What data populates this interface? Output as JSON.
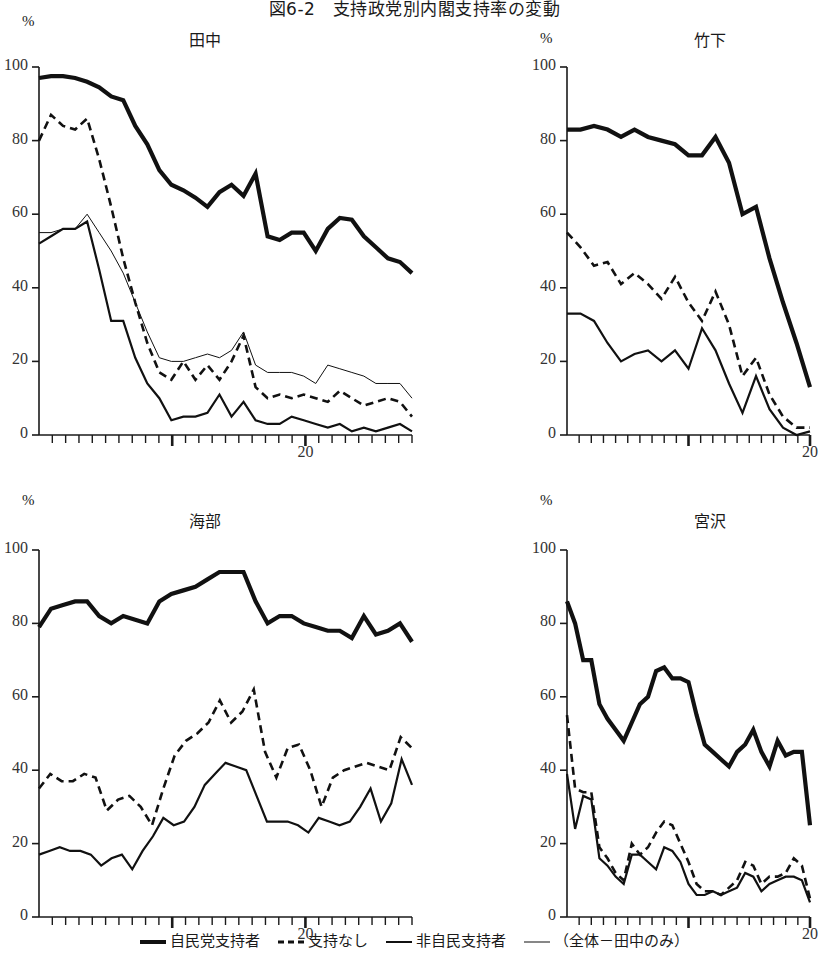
{
  "figure": {
    "title": "図6-2　支持政党別内閣支持率の変動",
    "y_axis_unit": "%",
    "y_ticks": [
      0,
      20,
      40,
      60,
      80,
      100
    ],
    "y_range": [
      0,
      100
    ]
  },
  "legend": {
    "position": "bottom-center",
    "items": [
      {
        "label": "自民党支持者",
        "style": "thick-solid",
        "color": "#111111"
      },
      {
        "label": "支持なし",
        "style": "dashed",
        "color": "#111111"
      },
      {
        "label": "非自民支持者",
        "style": "medium-solid",
        "color": "#111111"
      },
      {
        "label": "（全体－田中のみ）",
        "style": "thin-solid",
        "color": "#111111"
      }
    ]
  },
  "chart_data": [
    {
      "type": "line",
      "title": "田中",
      "ylabel": "%",
      "xlabel": "",
      "ylim": [
        0,
        100
      ],
      "grid": false,
      "n_ticks": 28,
      "x_tick_labels": [
        {
          "index": 20,
          "label": "20"
        }
      ],
      "series": [
        {
          "name": "自民党支持者",
          "style": "thick-solid",
          "values": [
            97,
            97.5,
            97.5,
            97,
            96,
            94.5,
            92,
            91,
            84,
            79,
            72,
            68,
            66.5,
            64.5,
            62,
            66,
            68,
            65,
            71,
            54,
            53,
            55,
            55,
            50,
            56,
            59,
            58.5,
            54,
            51,
            48,
            47,
            44
          ]
        },
        {
          "name": "支持なし",
          "style": "dashed",
          "values": [
            80,
            87,
            84,
            83,
            86,
            75,
            62,
            48,
            36,
            25,
            17,
            15,
            20,
            15,
            19,
            15,
            20,
            27,
            13,
            10,
            11,
            10,
            11,
            10,
            9,
            12,
            10,
            8,
            9,
            10,
            9,
            5
          ]
        },
        {
          "name": "非自民支持者",
          "style": "medium-solid",
          "values": [
            52,
            54,
            56,
            56,
            58,
            45,
            31,
            31,
            21,
            14,
            10,
            4,
            5,
            5,
            6,
            11,
            5,
            9,
            4,
            3,
            3,
            5,
            4,
            3,
            2,
            3,
            1,
            2,
            1,
            2,
            3,
            1
          ]
        },
        {
          "name": "（全体－田中のみ）",
          "style": "thin-solid",
          "values": [
            55,
            55,
            56,
            56,
            60,
            55,
            50,
            44,
            36,
            28,
            21,
            20,
            20,
            21,
            22,
            21,
            23,
            28,
            19,
            17,
            17,
            17,
            16,
            14,
            19,
            18,
            17,
            16,
            14,
            14,
            14,
            10
          ]
        }
      ]
    },
    {
      "type": "line",
      "title": "竹下",
      "ylabel": "%",
      "xlabel": "",
      "ylim": [
        0,
        100
      ],
      "grid": false,
      "n_ticks": 20,
      "x_tick_labels": [
        {
          "index": 20,
          "label": "20"
        }
      ],
      "series": [
        {
          "name": "自民党支持者",
          "style": "thick-solid",
          "values": [
            83,
            83,
            84,
            83,
            81,
            83,
            81,
            80,
            79,
            76,
            76,
            81,
            74,
            60,
            62,
            48,
            36,
            25,
            13
          ]
        },
        {
          "name": "支持なし",
          "style": "dashed",
          "values": [
            55,
            51,
            46,
            47,
            41,
            44,
            41,
            37,
            43,
            36,
            31,
            39,
            30,
            16,
            21,
            11,
            5,
            2,
            2
          ]
        },
        {
          "name": "非自民支持者",
          "style": "medium-solid",
          "values": [
            33,
            33,
            31,
            25,
            20,
            22,
            23,
            20,
            23,
            18,
            29,
            23,
            14,
            6,
            16,
            7,
            2,
            0,
            1
          ]
        }
      ]
    },
    {
      "type": "line",
      "title": "海部",
      "ylabel": "%",
      "xlabel": "",
      "ylim": [
        0,
        100
      ],
      "grid": false,
      "n_ticks": 28,
      "x_tick_labels": [
        {
          "index": 20,
          "label": "20"
        }
      ],
      "series": [
        {
          "name": "自民党支持者",
          "style": "thick-solid",
          "values": [
            79,
            84,
            85,
            86,
            86,
            82,
            80,
            82,
            81,
            80,
            86,
            88,
            89,
            90,
            92,
            94,
            94,
            94,
            86,
            80,
            82,
            82,
            80,
            79,
            78,
            78,
            76,
            82,
            77,
            78,
            80,
            75
          ]
        },
        {
          "name": "支持なし",
          "style": "dashed",
          "values": [
            35,
            39,
            37,
            37,
            39,
            38,
            29,
            32,
            33,
            30,
            25,
            35,
            44,
            48,
            50,
            53,
            59,
            53,
            56,
            62,
            45,
            38,
            46,
            47,
            40,
            30,
            38,
            40,
            41,
            42,
            41,
            40,
            49,
            46
          ]
        },
        {
          "name": "非自民支持者",
          "style": "medium-solid",
          "values": [
            17,
            18,
            19,
            18,
            18,
            17,
            14,
            16,
            17,
            13,
            18,
            22,
            27,
            25,
            26,
            30,
            36,
            39,
            42,
            41,
            40,
            33,
            26,
            26,
            26,
            25,
            23,
            27,
            26,
            25,
            26,
            30,
            35,
            26,
            31,
            43,
            36
          ]
        }
      ]
    },
    {
      "type": "line",
      "title": "宮沢",
      "ylabel": "%",
      "xlabel": "",
      "ylim": [
        0,
        100
      ],
      "grid": false,
      "n_ticks": 20,
      "x_tick_labels": [
        {
          "index": 20,
          "label": "20"
        }
      ],
      "series": [
        {
          "name": "自民党支持者",
          "style": "thick-solid",
          "values": [
            86,
            80,
            70,
            70,
            58,
            54,
            51,
            48,
            53,
            58,
            60,
            67,
            68,
            65,
            65,
            64,
            55,
            47,
            45,
            43,
            41,
            45,
            47,
            51,
            45,
            41,
            48,
            44,
            45,
            45,
            25
          ]
        },
        {
          "name": "支持なし",
          "style": "dashed",
          "values": [
            55,
            35,
            34,
            34,
            19,
            16,
            12,
            10,
            20,
            17,
            19,
            23,
            26,
            25,
            20,
            15,
            9,
            7,
            7,
            6,
            8,
            10,
            15,
            14,
            9,
            11,
            11,
            12,
            16,
            14,
            5
          ]
        },
        {
          "name": "非自民支持者",
          "style": "medium-solid",
          "values": [
            39,
            24,
            33,
            32,
            16,
            14,
            11,
            9,
            17,
            17,
            15,
            13,
            19,
            18,
            15,
            9,
            6,
            6,
            7,
            6,
            7,
            8,
            12,
            11,
            7,
            9,
            10,
            11,
            11,
            10,
            4
          ]
        }
      ]
    }
  ]
}
